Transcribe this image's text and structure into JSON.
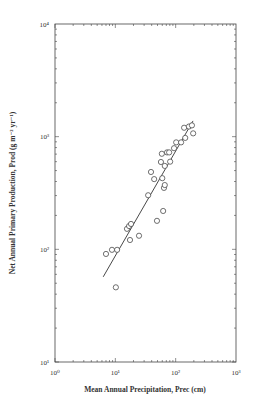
{
  "chart_data": {
    "type": "scatter",
    "title": "",
    "xlabel": "Mean Annual Precipitation, Prec (cm)",
    "ylabel": "Net Annual Primary Production, Prod (g m⁻² yr⁻¹)",
    "xscale": "log",
    "yscale": "log",
    "xlim": [
      1,
      1000
    ],
    "ylim": [
      10,
      10000
    ],
    "x_ticks": [
      1,
      10,
      100,
      1000
    ],
    "x_tick_labels": [
      "10⁰",
      "10¹",
      "10²",
      "10³"
    ],
    "y_ticks": [
      10,
      100,
      1000,
      10000
    ],
    "y_tick_labels": [
      "10¹",
      "10²",
      "10³",
      "10⁴"
    ],
    "grid": false,
    "legend": null,
    "series": [
      {
        "name": "observations",
        "marker": "open-circle",
        "points": [
          [
            7.0,
            91
          ],
          [
            8.8,
            99
          ],
          [
            10.7,
            99
          ],
          [
            10.2,
            46
          ],
          [
            17.5,
            121
          ],
          [
            15.6,
            152
          ],
          [
            16.9,
            161
          ],
          [
            18.2,
            168
          ],
          [
            24.7,
            132
          ],
          [
            49,
            179
          ],
          [
            62,
            219
          ],
          [
            35,
            302
          ],
          [
            39,
            486
          ],
          [
            44,
            420
          ],
          [
            64,
            351
          ],
          [
            66,
            372
          ],
          [
            60,
            428
          ],
          [
            66,
            550
          ],
          [
            57,
            596
          ],
          [
            72,
            725
          ],
          [
            59,
            705
          ],
          [
            78,
            725
          ],
          [
            81,
            600
          ],
          [
            94,
            790
          ],
          [
            102,
            890
          ],
          [
            123,
            890
          ],
          [
            138,
            1200
          ],
          [
            144,
            975
          ],
          [
            166,
            1230
          ],
          [
            186,
            1260
          ],
          [
            195,
            1070
          ]
        ]
      },
      {
        "name": "regression fit",
        "type": "line",
        "points": [
          [
            6.3,
            57
          ],
          [
            194,
            1380
          ]
        ]
      }
    ]
  },
  "labels": {
    "xlabel": "Mean Annual Precipitation, Prec (cm)",
    "ylabel": "Net Annual Primary Production, Prod (g m⁻² yr⁻¹)"
  }
}
